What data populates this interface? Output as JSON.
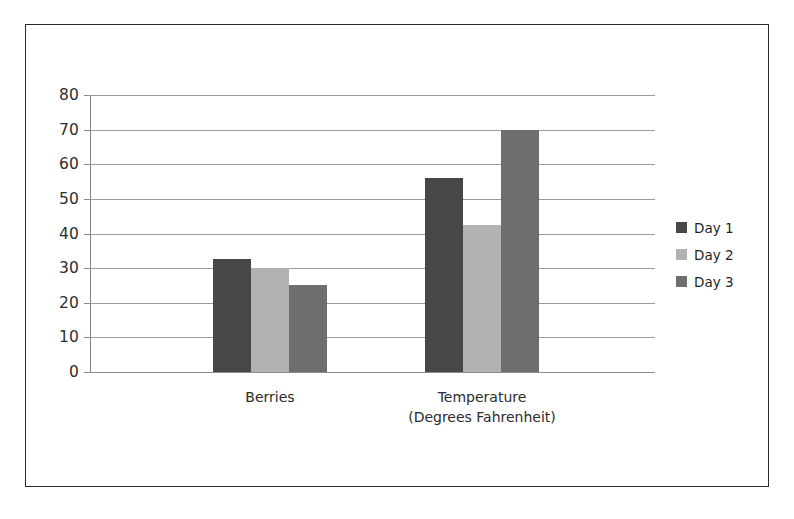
{
  "chart_data": {
    "type": "bar",
    "title": "",
    "subtitle": "",
    "xlabel": "",
    "ylabel": "",
    "categories": [
      "Berries",
      "Temperature\n(Degrees Fahrenheit)"
    ],
    "category_labels": [
      {
        "line1": "Berries",
        "line2": ""
      },
      {
        "line1": "Temperature",
        "line2": "(Degrees Fahrenheit)"
      }
    ],
    "series": [
      {
        "name": "Day 1",
        "color": "#474747",
        "values": [
          32.5,
          56
        ]
      },
      {
        "name": "Day 2",
        "color": "#b2b2b2",
        "values": [
          30,
          42.5
        ]
      },
      {
        "name": "Day 3",
        "color": "#6e6e6e",
        "values": [
          25,
          70
        ]
      }
    ],
    "ylim": [
      0,
      80
    ],
    "ytick_labels": [
      "0",
      "10",
      "20",
      "30",
      "40",
      "50",
      "60",
      "70",
      "80"
    ],
    "ytick_values": [
      0,
      10,
      20,
      30,
      40,
      50,
      60,
      70,
      80
    ],
    "grid": true,
    "legend_position": "right",
    "legend_entries": [
      "Day 1",
      "Day 2",
      "Day 3"
    ]
  },
  "legend": {
    "items": [
      {
        "label": "Day 1",
        "color": "#474747"
      },
      {
        "label": "Day 2",
        "color": "#b2b2b2"
      },
      {
        "label": "Day 3",
        "color": "#6e6e6e"
      }
    ]
  },
  "colors": {
    "day1": "#474747",
    "day2": "#b2b2b2",
    "day3": "#6e6e6e",
    "gridline": "#9a9a9a",
    "axis": "#808080",
    "frame": "#2b2b2b",
    "text": "#2b2b2b"
  }
}
